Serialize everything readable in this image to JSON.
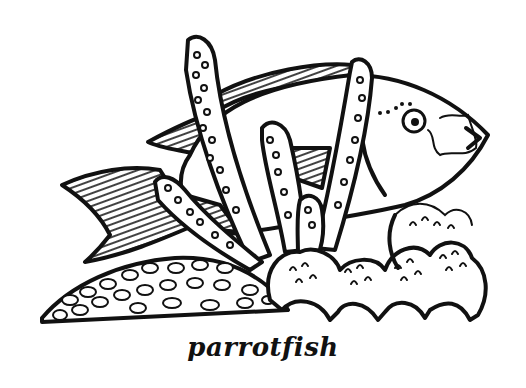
{
  "illustration": {
    "subject": "parrotfish",
    "style": "black-and-white line art coloring page",
    "elements": [
      "parrotfish",
      "finger coral branches",
      "brain coral mound",
      "cauliflower coral clumps"
    ]
  },
  "caption": "parrotfish",
  "colors": {
    "ink": "#111111",
    "background": "#ffffff"
  }
}
